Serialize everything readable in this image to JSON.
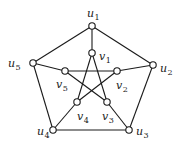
{
  "graph": {
    "name": "Petersen graph",
    "colors": {
      "stroke": "#1a1a1a",
      "node_fill": "#ffffff",
      "background": "#ffffff"
    },
    "nodes": [
      {
        "id": "u1",
        "base": "u",
        "sub": "1",
        "x": 92,
        "y": 26,
        "lx": 87,
        "ly": 17
      },
      {
        "id": "u2",
        "base": "u",
        "sub": "2",
        "x": 153,
        "y": 65,
        "lx": 160,
        "ly": 72
      },
      {
        "id": "u3",
        "base": "u",
        "sub": "3",
        "x": 129,
        "y": 130,
        "lx": 136,
        "ly": 135
      },
      {
        "id": "u4",
        "base": "u",
        "sub": "4",
        "x": 53,
        "y": 130,
        "lx": 37,
        "ly": 135
      },
      {
        "id": "u5",
        "base": "u",
        "sub": "5",
        "x": 33,
        "y": 63,
        "lx": 8,
        "ly": 67
      },
      {
        "id": "v1",
        "base": "v",
        "sub": "1",
        "x": 92,
        "y": 53,
        "lx": 99,
        "ly": 60
      },
      {
        "id": "v2",
        "base": "v",
        "sub": "2",
        "x": 117,
        "y": 71,
        "lx": 116,
        "ly": 89
      },
      {
        "id": "v3",
        "base": "v",
        "sub": "3",
        "x": 107,
        "y": 102,
        "lx": 102,
        "ly": 120
      },
      {
        "id": "v4",
        "base": "v",
        "sub": "4",
        "x": 77,
        "y": 102,
        "lx": 77,
        "ly": 120
      },
      {
        "id": "v5",
        "base": "v",
        "sub": "5",
        "x": 65,
        "y": 71,
        "lx": 56,
        "ly": 88
      }
    ],
    "edges": [
      [
        "u1",
        "u2"
      ],
      [
        "u2",
        "u3"
      ],
      [
        "u3",
        "u4"
      ],
      [
        "u4",
        "u5"
      ],
      [
        "u5",
        "u1"
      ],
      [
        "u1",
        "v1"
      ],
      [
        "u2",
        "v2"
      ],
      [
        "u3",
        "v3"
      ],
      [
        "u4",
        "v4"
      ],
      [
        "u5",
        "v5"
      ],
      [
        "v1",
        "v3"
      ],
      [
        "v3",
        "v5"
      ],
      [
        "v5",
        "v2"
      ],
      [
        "v2",
        "v4"
      ],
      [
        "v4",
        "v1"
      ]
    ],
    "node_radius": 3.2
  }
}
